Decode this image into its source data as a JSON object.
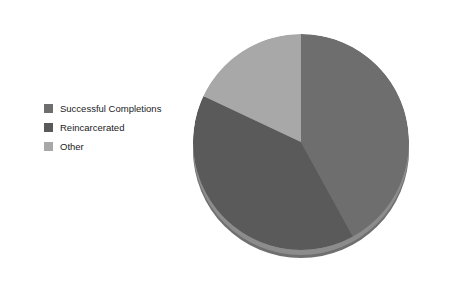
{
  "chart_data": {
    "type": "pie",
    "title": "",
    "subtitle": "",
    "xlabel": "",
    "ylabel": "",
    "grid": false,
    "legend_position": "left",
    "start_angle_deg": 0,
    "direction": "clockwise",
    "three_d": true,
    "categories": [
      "Successful Completions",
      "Reincarcerated",
      "Other"
    ],
    "values": [
      42,
      40,
      18
    ],
    "units": "percent",
    "colors": [
      "#6e6e6e",
      "#5a5a5a",
      "#a8a8a8"
    ],
    "slices": [
      {
        "label": "Successful Completions",
        "value": 42,
        "color": "#6e6e6e",
        "start_deg": 0,
        "end_deg": 151.2
      },
      {
        "label": "Reincarcerated",
        "value": 40,
        "color": "#5a5a5a",
        "start_deg": 151.2,
        "end_deg": 295.2
      },
      {
        "label": "Other",
        "value": 18,
        "color": "#a8a8a8",
        "start_deg": 295.2,
        "end_deg": 360
      }
    ]
  },
  "legend": {
    "items": [
      {
        "label": "Successful Completions",
        "color": "#6e6e6e"
      },
      {
        "label": "Reincarcerated",
        "color": "#5a5a5a"
      },
      {
        "label": "Other",
        "color": "#a8a8a8"
      }
    ]
  },
  "canvas": {
    "background": "#ffffff",
    "depth_color": "#6f6f6f",
    "depth_shade_color": "#8c8c8c"
  }
}
